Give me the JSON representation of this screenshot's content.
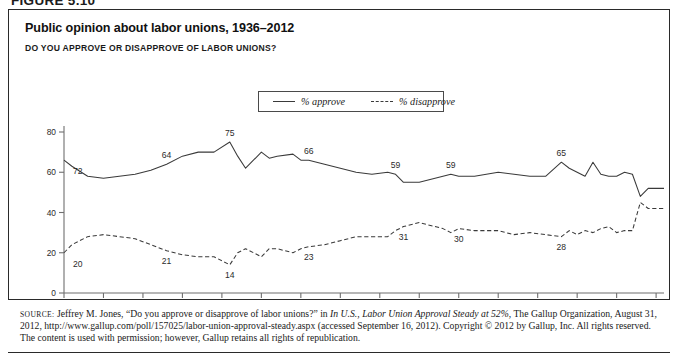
{
  "figure_label": "FIGURE 5.10",
  "figure": {
    "title": "Public opinion about labor unions, 1936–2012",
    "subtitle": "DO YOU APPROVE OR DISAPPROVE OF LABOR UNIONS?"
  },
  "legend": {
    "approve_label": "% approve",
    "disapprove_label": "% disapprove",
    "position": "top-center-inside"
  },
  "source": {
    "prefix": "SOURCE:",
    "text_1": " Jeffrey M. Jones, “Do you approve or disapprove of labor unions?” in ",
    "italic_1": "In U.S., Labor Union Approval Steady at 52%",
    "text_2": ", The Gallup Organization, August 31, 2012, http://www.gallup.com/poll/157025/labor-union-approval-steady.aspx (accessed September 16, 2012). Copyright © 2012 by Gallup, Inc. All rights reserved. The content is used with permission; however, Gallup retains all rights of republication."
  },
  "colors": {
    "line": "#3a3a3a",
    "axis": "#6f6f6f",
    "border": "#2a2a2a",
    "text": "#1a1a1a"
  },
  "chart_data": {
    "type": "line",
    "title": "Public opinion about labor unions, 1936–2012",
    "subtitle": "DO YOU APPROVE OR DISAPPROVE OF LABOR UNIONS?",
    "xlabel": "",
    "ylabel": "",
    "xlim": [
      1936,
      2012
    ],
    "ylim": [
      0,
      80
    ],
    "yticks": [
      0,
      20,
      40,
      60,
      80
    ],
    "xticks": [
      1936,
      1941,
      1946,
      1951,
      1956,
      1961,
      1966,
      1971,
      1976,
      1981,
      1986,
      1991,
      1996,
      2001,
      2006,
      2011
    ],
    "grid": false,
    "legend": [
      "% approve",
      "% disapprove"
    ],
    "annotations": [
      {
        "series": "% approve",
        "x": 1936,
        "value": 72
      },
      {
        "series": "% approve",
        "x": 1949,
        "value": 64
      },
      {
        "series": "% approve",
        "x": 1957,
        "value": 75
      },
      {
        "series": "% approve",
        "x": 1967,
        "value": 66
      },
      {
        "series": "% approve",
        "x": 1978,
        "value": 59
      },
      {
        "series": "% approve",
        "x": 1985,
        "value": 59
      },
      {
        "series": "% approve",
        "x": 1999,
        "value": 65
      },
      {
        "series": "% approve",
        "x": 2012,
        "value": 52
      },
      {
        "series": "% disapprove",
        "x": 1936,
        "value": 20
      },
      {
        "series": "% disapprove",
        "x": 1949,
        "value": 21
      },
      {
        "series": "% disapprove",
        "x": 1957,
        "value": 14
      },
      {
        "series": "% disapprove",
        "x": 1967,
        "value": 23
      },
      {
        "series": "% disapprove",
        "x": 1979,
        "value": 31
      },
      {
        "series": "% disapprove",
        "x": 1986,
        "value": 30
      },
      {
        "series": "% disapprove",
        "x": 1999,
        "value": 28
      },
      {
        "series": "% disapprove",
        "x": 2012,
        "value": 42
      }
    ],
    "series": [
      {
        "name": "% approve",
        "x": [
          1936,
          1937,
          1939,
          1941,
          1943,
          1945,
          1947,
          1949,
          1951,
          1953,
          1955,
          1957,
          1958,
          1959,
          1961,
          1962,
          1963,
          1965,
          1966,
          1967,
          1969,
          1971,
          1973,
          1975,
          1977,
          1978,
          1979,
          1981,
          1982,
          1984,
          1985,
          1986,
          1988,
          1991,
          1993,
          1995,
          1997,
          1999,
          2000,
          2001,
          2002,
          2003,
          2004,
          2005,
          2006,
          2007,
          2008,
          2009,
          2010,
          2011,
          2012
        ],
        "values": [
          66,
          63,
          58,
          57,
          58,
          59,
          61,
          64,
          68,
          70,
          70,
          75,
          68,
          62,
          70,
          67,
          68,
          69,
          66,
          66,
          64,
          62,
          60,
          59,
          60,
          59,
          55,
          55,
          56,
          58,
          59,
          58,
          58,
          60,
          59,
          58,
          58,
          65,
          62,
          60,
          58,
          65,
          59,
          58,
          58,
          60,
          59,
          48,
          52,
          52,
          52
        ]
      },
      {
        "name": "% disapprove",
        "x": [
          1936,
          1937,
          1939,
          1941,
          1943,
          1945,
          1947,
          1949,
          1951,
          1953,
          1955,
          1957,
          1958,
          1959,
          1961,
          1962,
          1963,
          1965,
          1966,
          1967,
          1969,
          1971,
          1973,
          1975,
          1977,
          1978,
          1979,
          1981,
          1982,
          1984,
          1985,
          1986,
          1988,
          1991,
          1993,
          1995,
          1997,
          1999,
          2000,
          2001,
          2002,
          2003,
          2004,
          2005,
          2006,
          2007,
          2008,
          2009,
          2010,
          2011,
          2012
        ],
        "values": [
          20,
          24,
          28,
          29,
          28,
          27,
          24,
          21,
          19,
          18,
          18,
          14,
          20,
          22,
          18,
          22,
          22,
          20,
          22,
          23,
          24,
          26,
          28,
          28,
          28,
          31,
          33,
          35,
          34,
          32,
          30,
          32,
          31,
          31,
          29,
          30,
          29,
          28,
          31,
          29,
          31,
          30,
          32,
          33,
          30,
          31,
          31,
          45,
          42,
          42,
          42
        ]
      }
    ]
  }
}
